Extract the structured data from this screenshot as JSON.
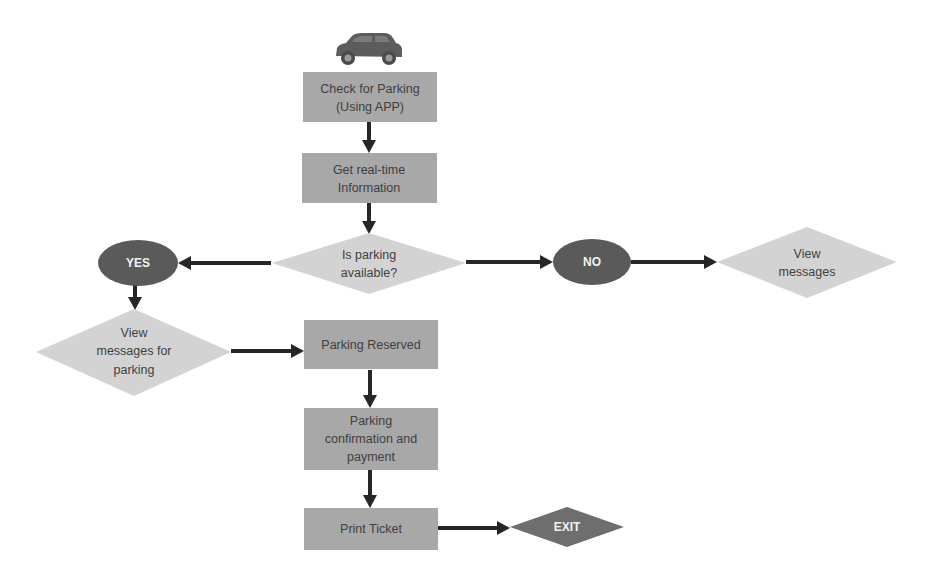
{
  "diagram": {
    "type": "flowchart",
    "start_icon": "car-icon",
    "nodes": {
      "check_parking": {
        "shape": "rectangle",
        "lines": [
          "Check for Parking",
          "(Using APP)"
        ]
      },
      "realtime_info": {
        "shape": "rectangle",
        "lines": [
          "Get real-time",
          "Information"
        ]
      },
      "is_available": {
        "shape": "diamond",
        "lines": [
          "Is parking",
          "available?"
        ]
      },
      "yes": {
        "shape": "ellipse",
        "lines": [
          "YES"
        ]
      },
      "no": {
        "shape": "ellipse",
        "lines": [
          "NO"
        ]
      },
      "view_messages": {
        "shape": "diamond",
        "lines": [
          "View",
          "messages"
        ]
      },
      "view_messages_parking": {
        "shape": "diamond",
        "lines": [
          "View",
          "messages for",
          "parking"
        ]
      },
      "reserved": {
        "shape": "rectangle",
        "lines": [
          "Parking Reserved"
        ]
      },
      "confirmation": {
        "shape": "rectangle",
        "lines": [
          "Parking",
          "confirmation and",
          "payment"
        ]
      },
      "print_ticket": {
        "shape": "rectangle",
        "lines": [
          "Print Ticket"
        ]
      },
      "exit": {
        "shape": "diamond",
        "lines": [
          "EXIT"
        ]
      }
    },
    "edges": [
      {
        "from": "check_parking",
        "to": "realtime_info"
      },
      {
        "from": "realtime_info",
        "to": "is_available"
      },
      {
        "from": "is_available",
        "to": "yes"
      },
      {
        "from": "is_available",
        "to": "no"
      },
      {
        "from": "no",
        "to": "view_messages"
      },
      {
        "from": "yes",
        "to": "view_messages_parking"
      },
      {
        "from": "view_messages_parking",
        "to": "reserved"
      },
      {
        "from": "reserved",
        "to": "confirmation"
      },
      {
        "from": "confirmation",
        "to": "print_ticket"
      },
      {
        "from": "print_ticket",
        "to": "exit"
      }
    ],
    "colors": {
      "process_box": "#a8a8a8",
      "decision": "#d3d3d3",
      "terminal_ellipse": "#5a5a5a",
      "exit": "#6e6e6e",
      "arrow": "#262626",
      "text": "#3f3f3f"
    }
  }
}
